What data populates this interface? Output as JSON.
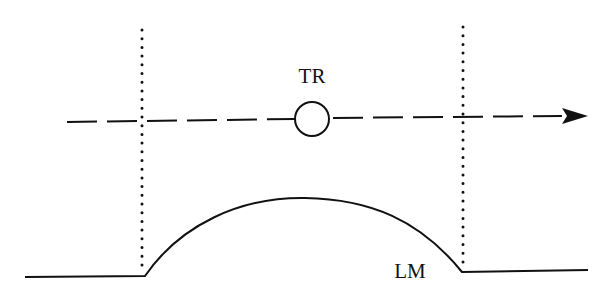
{
  "diagram": {
    "labels": {
      "trajectory_marker": "TR",
      "surface": "LM"
    },
    "elements": {
      "left_boundary": "dotted vertical line",
      "right_boundary": "dotted vertical line",
      "path": "dashed arrow pointing right",
      "marker": "open circle",
      "profile": "flat baseline with raised arc between boundaries"
    },
    "colors": {
      "stroke": "#111111",
      "background": "#ffffff"
    }
  }
}
